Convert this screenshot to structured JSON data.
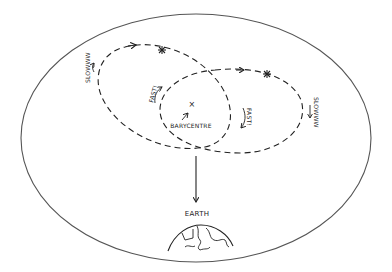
{
  "diagram": {
    "title_shown": false,
    "region": {
      "shape": "ellipse",
      "cx": 196,
      "cy": 138,
      "rx": 175,
      "ry": 124,
      "stroke": "#555555"
    },
    "orbits": [
      {
        "name": "star-orbit-left",
        "style": "dashed"
      },
      {
        "name": "star-orbit-right",
        "style": "dashed"
      }
    ],
    "stars": [
      {
        "name": "star-1",
        "glyph": "*",
        "x": 162,
        "y": 50
      },
      {
        "name": "star-2",
        "glyph": "*",
        "x": 267,
        "y": 74
      }
    ],
    "labels": {
      "slow_left": "SLOWWW",
      "fast_left": "FAST!",
      "fast_right": "FAST!",
      "slow_right": "SLOWWW",
      "barycentre": "BARYCENTRE",
      "barycentre_marker": "×",
      "earth": "EARTH"
    },
    "colors": {
      "line": "#222222",
      "outline": "#555555",
      "background": "#ffffff"
    }
  }
}
